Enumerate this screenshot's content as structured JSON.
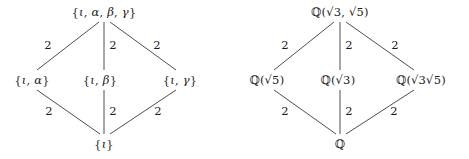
{
  "figure": {
    "background_color": "#ffffff",
    "line_color": "#3a3a3a",
    "text_color": "#1a1a1a"
  },
  "diagrams": [
    {
      "id": "galois-groups",
      "name": "lattice-of-subgroups",
      "nodes": {
        "top": "{ι, α, β, γ}",
        "left": "{ι, α}",
        "middle": "{ι, β}",
        "right": "{ι, γ}",
        "bottom": "{ι}"
      },
      "edge_labels": {
        "top_left": "2",
        "top_middle": "2",
        "top_right": "2",
        "bottom_left": "2",
        "bottom_middle": "2",
        "bottom_right": "2"
      }
    },
    {
      "id": "subfields",
      "name": "lattice-of-subfields",
      "nodes": {
        "top": "ℚ(√3, √5)",
        "left": "ℚ(√5)",
        "middle": "ℚ(√3)",
        "right": "ℚ(√3√5)",
        "bottom": "ℚ"
      },
      "edge_labels": {
        "top_left": "2",
        "top_middle": "2",
        "top_right": "2",
        "bottom_left": "2",
        "bottom_middle": "2",
        "bottom_right": "2"
      }
    }
  ]
}
